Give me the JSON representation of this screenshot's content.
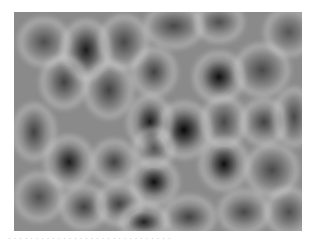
{
  "image": {
    "description": "Grayscale cellular texture with light ridges surrounding dark blob-shaped cells",
    "colors": {
      "base": "#8a8a8a",
      "ridge": "#ebebeb",
      "dark_core": "#0a0a0a"
    },
    "blobs": [
      {
        "x": 72,
        "y": 38,
        "w": 30,
        "h": 42,
        "shade": 0.85
      },
      {
        "x": 110,
        "y": 30,
        "w": 30,
        "h": 36,
        "shade": 0.5
      },
      {
        "x": 160,
        "y": 14,
        "w": 40,
        "h": 26,
        "shade": 0.5
      },
      {
        "x": 205,
        "y": 10,
        "w": 30,
        "h": 22,
        "shade": 0.45
      },
      {
        "x": 30,
        "y": 30,
        "w": 32,
        "h": 30,
        "shade": 0.45
      },
      {
        "x": 50,
        "y": 70,
        "w": 28,
        "h": 34,
        "shade": 0.55
      },
      {
        "x": 95,
        "y": 78,
        "w": 30,
        "h": 38,
        "shade": 0.55
      },
      {
        "x": 140,
        "y": 60,
        "w": 26,
        "h": 30,
        "shade": 0.55
      },
      {
        "x": 205,
        "y": 65,
        "w": 32,
        "h": 32,
        "shade": 0.95
      },
      {
        "x": 248,
        "y": 58,
        "w": 36,
        "h": 34,
        "shade": 0.5
      },
      {
        "x": 275,
        "y": 20,
        "w": 30,
        "h": 30,
        "shade": 0.4
      },
      {
        "x": 170,
        "y": 118,
        "w": 36,
        "h": 38,
        "shade": 1.0
      },
      {
        "x": 136,
        "y": 110,
        "w": 26,
        "h": 36,
        "shade": 0.85
      },
      {
        "x": 140,
        "y": 136,
        "w": 22,
        "h": 22,
        "shade": 0.5
      },
      {
        "x": 210,
        "y": 110,
        "w": 26,
        "h": 34,
        "shade": 0.5
      },
      {
        "x": 250,
        "y": 110,
        "w": 28,
        "h": 28,
        "shade": 0.55
      },
      {
        "x": 280,
        "y": 105,
        "w": 22,
        "h": 40,
        "shade": 0.5
      },
      {
        "x": 20,
        "y": 120,
        "w": 24,
        "h": 38,
        "shade": 0.55
      },
      {
        "x": 55,
        "y": 150,
        "w": 30,
        "h": 34,
        "shade": 0.85
      },
      {
        "x": 100,
        "y": 150,
        "w": 26,
        "h": 26,
        "shade": 0.55
      },
      {
        "x": 140,
        "y": 170,
        "w": 30,
        "h": 28,
        "shade": 0.95
      },
      {
        "x": 210,
        "y": 152,
        "w": 30,
        "h": 34,
        "shade": 0.95
      },
      {
        "x": 258,
        "y": 158,
        "w": 34,
        "h": 34,
        "shade": 0.5
      },
      {
        "x": 25,
        "y": 185,
        "w": 30,
        "h": 30,
        "shade": 0.45
      },
      {
        "x": 70,
        "y": 195,
        "w": 28,
        "h": 26,
        "shade": 0.55
      },
      {
        "x": 105,
        "y": 192,
        "w": 28,
        "h": 24,
        "shade": 0.55
      },
      {
        "x": 130,
        "y": 210,
        "w": 30,
        "h": 20,
        "shade": 0.8
      },
      {
        "x": 175,
        "y": 205,
        "w": 34,
        "h": 24,
        "shade": 0.55
      },
      {
        "x": 230,
        "y": 200,
        "w": 32,
        "h": 26,
        "shade": 0.5
      },
      {
        "x": 275,
        "y": 200,
        "w": 28,
        "h": 30,
        "shade": 0.45
      }
    ]
  },
  "caption": {
    "text": "· · · · · · · · · · · · · · · · · · · · · · · · · · · · · ·"
  }
}
